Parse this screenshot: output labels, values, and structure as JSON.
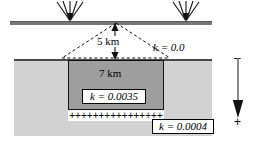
{
  "diagram": {
    "surface": {
      "name": "ground-surface"
    },
    "recharge_symbols": [
      {
        "name": "recharge-arrow-left"
      },
      {
        "name": "recharge-arrow-right"
      }
    ],
    "dimensions": {
      "depth_label": "5 km",
      "width_label": "7 km"
    },
    "hydraulic_conductivity": {
      "unsaturated_zone": "k = 0.0",
      "source_block": "k = 0.0035",
      "aquifer": "k = 0.0004"
    },
    "boundary": {
      "plus_row": "++++++++++++++++"
    },
    "depth_axis": {
      "negative_sign": "–",
      "positive_sign": "+"
    },
    "colors": {
      "aquifer_fill": "#d2d2d2",
      "block_fill": "#9e9e9e",
      "ground_line": "#787878",
      "outline": "#111111",
      "background": "#ffffff"
    }
  }
}
